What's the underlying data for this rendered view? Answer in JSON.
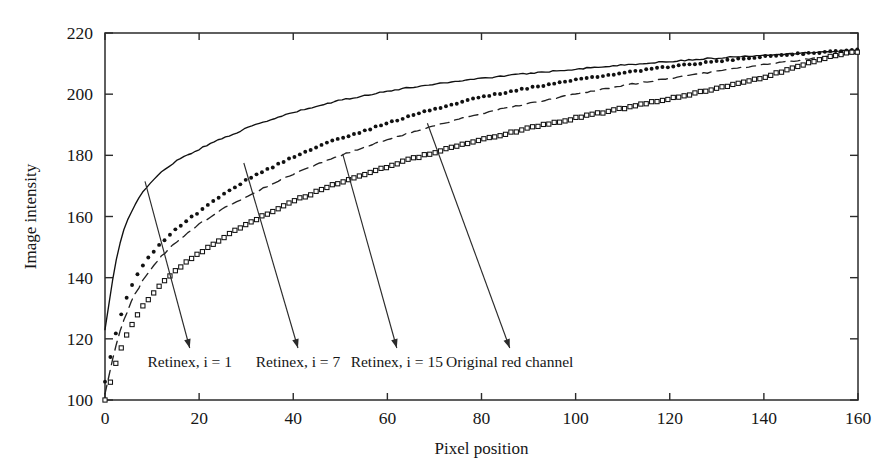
{
  "chart_data": {
    "type": "line",
    "title": "",
    "xlabel": "Pixel position",
    "ylabel": "Image intensity",
    "xlim": [
      0,
      160
    ],
    "ylim": [
      100,
      220
    ],
    "xticks": [
      0,
      20,
      40,
      60,
      80,
      100,
      120,
      140,
      160
    ],
    "xtick_labels": [
      "0",
      "20",
      "40",
      "60",
      "80",
      "100",
      "120",
      "140",
      "160"
    ],
    "yticks": [
      100,
      120,
      140,
      160,
      180,
      200,
      220
    ],
    "ytick_labels": [
      "100",
      "120",
      "140",
      "160",
      "180",
      "200",
      "220"
    ],
    "grid": false,
    "legend_position": "inline-annotations",
    "frame": "box",
    "series": [
      {
        "name": "Retinex, i = 1",
        "style": "solid-line",
        "marker": "none",
        "color": "#111111",
        "x": [
          0,
          1,
          2,
          3,
          4,
          5,
          6,
          8,
          10,
          12,
          14,
          16,
          18,
          20,
          24,
          28,
          32,
          36,
          40,
          45,
          50,
          55,
          60,
          65,
          70,
          75,
          80,
          85,
          90,
          95,
          100,
          105,
          110,
          115,
          120,
          125,
          130,
          135,
          140,
          145,
          150,
          155,
          160
        ],
        "y": [
          123,
          133,
          143,
          150,
          155.5,
          159.5,
          163,
          168,
          171.5,
          174.5,
          177,
          179,
          180.5,
          182,
          185,
          187.5,
          190,
          192,
          194,
          196,
          198,
          199.5,
          201,
          202.2,
          203.3,
          204.3,
          205.2,
          206,
          206.8,
          207.5,
          208.2,
          208.9,
          209.5,
          210.1,
          210.7,
          211.3,
          211.8,
          212.3,
          212.8,
          213.2,
          213.6,
          214,
          214.4
        ]
      },
      {
        "name": "Retinex, i = 7",
        "style": "dotted-markers",
        "marker": "filled-circle",
        "color": "#111111",
        "x": [
          0,
          1,
          2,
          3,
          4,
          5,
          6,
          7,
          8,
          10,
          12,
          14,
          16,
          18,
          20,
          23,
          26,
          29,
          32,
          36,
          40,
          44,
          48,
          52,
          56,
          60,
          65,
          70,
          75,
          80,
          85,
          90,
          95,
          100,
          105,
          110,
          115,
          120,
          125,
          130,
          135,
          140,
          145,
          150,
          155,
          160
        ],
        "y": [
          106,
          113,
          120,
          126,
          131,
          135,
          138.5,
          141.5,
          144,
          148,
          151.5,
          154.5,
          157,
          159.5,
          161.5,
          165,
          168,
          171,
          173.5,
          176.5,
          179.5,
          182,
          184.5,
          186.5,
          188.5,
          190.5,
          193,
          195.2,
          197.2,
          199,
          200.6,
          202,
          203.3,
          204.6,
          205.8,
          207,
          208,
          209,
          209.9,
          210.7,
          211.5,
          212.2,
          212.9,
          213.5,
          214,
          214.5
        ]
      },
      {
        "name": "Retinex, i = 15",
        "style": "dashed-line",
        "marker": "none",
        "color": "#222222",
        "x": [
          0,
          1,
          2,
          3,
          4,
          5,
          6,
          8,
          10,
          12,
          14,
          16,
          18,
          20,
          24,
          28,
          32,
          36,
          40,
          45,
          50,
          55,
          60,
          65,
          70,
          75,
          80,
          85,
          90,
          95,
          100,
          105,
          110,
          115,
          120,
          125,
          130,
          135,
          140,
          145,
          150,
          155,
          160
        ],
        "y": [
          102,
          109,
          116,
          121.5,
          126,
          130,
          133.5,
          139,
          143.5,
          147,
          150,
          152.8,
          155.2,
          157.5,
          161.5,
          165,
          168,
          171,
          173.8,
          177,
          180,
          182.7,
          185.2,
          187.5,
          189.7,
          191.7,
          193.6,
          195.4,
          197,
          198.5,
          200,
          201.4,
          202.8,
          204,
          205.2,
          206.4,
          207.5,
          208.6,
          209.6,
          210.6,
          211.6,
          212.5,
          213.4
        ]
      },
      {
        "name": "Original red channel",
        "style": "dotted-markers",
        "marker": "open-square",
        "color": "#111111",
        "x": [
          0,
          1,
          2,
          3,
          4,
          5,
          6,
          7,
          8,
          10,
          12,
          14,
          16,
          18,
          20,
          23,
          26,
          29,
          32,
          36,
          40,
          44,
          48,
          52,
          56,
          60,
          65,
          70,
          75,
          80,
          85,
          90,
          95,
          100,
          105,
          110,
          115,
          120,
          125,
          130,
          135,
          140,
          145,
          150,
          155,
          160
        ],
        "y": [
          100,
          105,
          110.5,
          115,
          119,
          122.5,
          125.5,
          128,
          130.5,
          134.5,
          138,
          141,
          143.5,
          146,
          148,
          151,
          154,
          156.5,
          159,
          162,
          165,
          167.5,
          170,
          172.2,
          174.3,
          176.3,
          178.8,
          181,
          183.2,
          185.2,
          187,
          188.8,
          190.5,
          192.2,
          193.8,
          195.4,
          197,
          198.6,
          200.2,
          201.8,
          203.5,
          205.5,
          208,
          210.5,
          212.5,
          214
        ]
      }
    ],
    "annotations": [
      {
        "label": "Retinex, i = 1",
        "anchor_x": 8.5,
        "anchor_y": 171.5,
        "label_x": 18,
        "label_y": 117
      },
      {
        "label": "Retinex, i = 7",
        "anchor_x": 29.5,
        "anchor_y": 177.5,
        "label_x": 41,
        "label_y": 117
      },
      {
        "label": "Retinex, i = 15",
        "anchor_x": 50.5,
        "anchor_y": 180.5,
        "label_x": 62,
        "label_y": 117
      },
      {
        "label": "Original red channel",
        "anchor_x": 68.5,
        "anchor_y": 190.5,
        "label_x": 86,
        "label_y": 117
      }
    ]
  }
}
